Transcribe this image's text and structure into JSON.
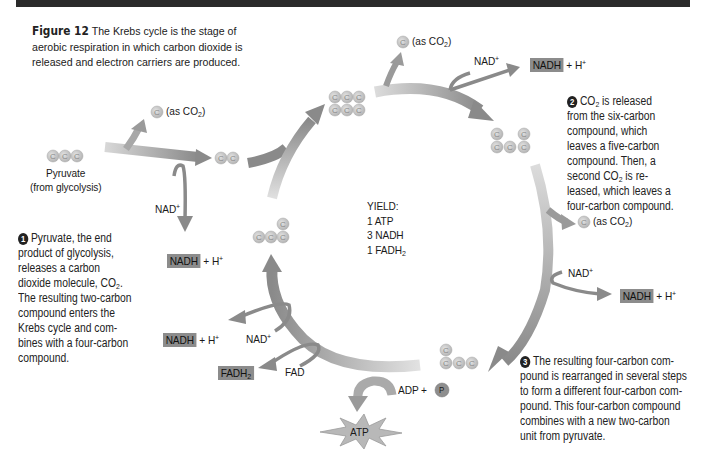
{
  "figure": {
    "label": "Figure 12",
    "caption_lines": [
      "The Krebs cycle is the stage of",
      "aerobic respiration in which carbon dioxide is",
      "released and electron carriers are produced."
    ]
  },
  "pyruvate": {
    "name": "Pyruvate",
    "source": "(from glycolysis)",
    "carbons": "C C C"
  },
  "co2_release": {
    "prefix": "(as CO",
    "subscript": "2",
    "suffix": ")"
  },
  "carrier_labels": {
    "nad_plus": "NAD",
    "plus_sign": "+",
    "nadh": "NADH",
    "h_plus": "+ H",
    "fad": "FAD",
    "fadh2": "FADH",
    "fadh2_sub": "2",
    "adp": "ADP +",
    "phosphate": "P",
    "atp": "ATP"
  },
  "yield": {
    "title": "YIELD:",
    "items": [
      "1 ATP",
      "3 NADH",
      "1 FADH"
    ],
    "fadh_sub": "2"
  },
  "steps": [
    {
      "number": "1",
      "lines": [
        "Pyruvate, the end",
        "product of glycolysis,",
        "releases a carbon",
        "dioxide molecule, CO",
        "The resulting two-carbon",
        "compound enters the",
        "Krebs cycle and com-",
        "bines with a four-carbon",
        "compound."
      ]
    },
    {
      "number": "2",
      "lines": [
        " is released",
        "from the six-carbon",
        "compound, which",
        "leaves a five-carbon",
        "compound. Then, a",
        "second CO",
        " is re-",
        "leased, which leaves a",
        "four-carbon compound."
      ]
    },
    {
      "number": "3",
      "lines": [
        "The resulting four-carbon com-",
        "pound is rearranged in several steps",
        "to form a different four-carbon com-",
        "pound. This four-carbon compound",
        "combines with a new two-carbon",
        "unit from pyruvate."
      ]
    }
  ],
  "colors": {
    "arrow": "#8a8a8a",
    "arrow_light": "#d0d0d0",
    "carbon_fill": "#c8c8c8",
    "carrier_box": "#8c8c8c",
    "top_band": "#2a2a2a"
  }
}
